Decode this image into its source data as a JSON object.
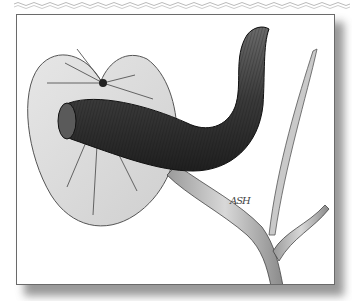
{
  "illustration": {
    "subject": "leech on a lily pad with plant stems",
    "style": "pencil drawing, grayscale",
    "signature": "ASH",
    "colors": {
      "frame_border": "#6a6a6a",
      "shadow": "#777777",
      "leaf_fill": "#d9d9d9",
      "body_dark": "#3a3a3a",
      "stem_fill": "#c8c8c8"
    }
  }
}
